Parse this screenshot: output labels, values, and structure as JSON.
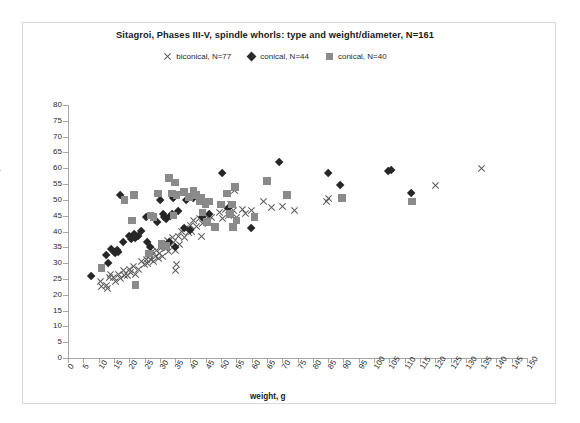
{
  "chart_data": {
    "type": "scatter",
    "title": "Sitagroi, Phases III-V, spindle whorls: type and weight/diameter, N=161",
    "xlabel": "weight, g",
    "ylabel": "diameter, mm",
    "xlim": [
      0,
      150
    ],
    "ylim": [
      0,
      80
    ],
    "xtick_step": 5,
    "ytick_step": 5,
    "xticks": [
      0,
      5,
      10,
      15,
      20,
      25,
      30,
      35,
      40,
      45,
      50,
      55,
      60,
      65,
      70,
      75,
      80,
      85,
      90,
      95,
      100,
      105,
      110,
      115,
      120,
      125,
      130,
      135,
      140,
      145,
      150
    ],
    "yticks": [
      0,
      5,
      10,
      15,
      20,
      25,
      30,
      35,
      40,
      45,
      50,
      55,
      60,
      65,
      70,
      75,
      80
    ],
    "grid": false,
    "legend_position": "top-center",
    "colors": {
      "biconical": "#595959",
      "conical_diamond": "#262626",
      "conical_square": "#8a8a8a",
      "axis": "#a6a6a6",
      "text": "#1a1a1a",
      "frame": "#d8d8d8",
      "background": "#ffffff"
    },
    "series": [
      {
        "name": "biconical, N=77",
        "marker": "cross",
        "color": "#595959",
        "points": [
          [
            10.5,
            24.0
          ],
          [
            11.0,
            22.6
          ],
          [
            12.5,
            23.0
          ],
          [
            13.0,
            22.0
          ],
          [
            13.5,
            25.5
          ],
          [
            14.0,
            26.5
          ],
          [
            15.0,
            25.5
          ],
          [
            15.5,
            24.0
          ],
          [
            16.5,
            26.5
          ],
          [
            17.0,
            25.0
          ],
          [
            18.0,
            27.5
          ],
          [
            18.5,
            26.0
          ],
          [
            19.5,
            26.0
          ],
          [
            20.0,
            28.0
          ],
          [
            20.5,
            27.0
          ],
          [
            21.5,
            29.0
          ],
          [
            22.0,
            26.5
          ],
          [
            23.0,
            28.0
          ],
          [
            24.0,
            30.5
          ],
          [
            25.0,
            29.5
          ],
          [
            25.5,
            31.0
          ],
          [
            26.0,
            30.0
          ],
          [
            26.5,
            32.5
          ],
          [
            27.0,
            31.0
          ],
          [
            27.5,
            33.5
          ],
          [
            28.0,
            30.5
          ],
          [
            28.5,
            32.0
          ],
          [
            29.0,
            34.0
          ],
          [
            29.5,
            31.5
          ],
          [
            30.0,
            33.0
          ],
          [
            30.5,
            35.0
          ],
          [
            31.0,
            32.0
          ],
          [
            31.5,
            36.0
          ],
          [
            32.0,
            34.5
          ],
          [
            32.5,
            37.0
          ],
          [
            33.0,
            33.5
          ],
          [
            33.5,
            35.5
          ],
          [
            34.0,
            38.0
          ],
          [
            34.5,
            36.5
          ],
          [
            35.0,
            34.0
          ],
          [
            35.0,
            27.5
          ],
          [
            35.5,
            29.5
          ],
          [
            36.0,
            38.5
          ],
          [
            36.5,
            36.0
          ],
          [
            37.0,
            40.0
          ],
          [
            38.0,
            38.0
          ],
          [
            38.5,
            41.0
          ],
          [
            39.5,
            39.5
          ],
          [
            40.0,
            42.0
          ],
          [
            40.5,
            40.0
          ],
          [
            41.0,
            43.5
          ],
          [
            42.0,
            41.5
          ],
          [
            43.0,
            44.0
          ],
          [
            43.5,
            38.5
          ],
          [
            44.0,
            42.5
          ],
          [
            45.0,
            45.0
          ],
          [
            46.0,
            43.0
          ],
          [
            47.0,
            44.5
          ],
          [
            48.0,
            41.5
          ],
          [
            49.5,
            46.0
          ],
          [
            50.5,
            44.0
          ],
          [
            51.5,
            47.0
          ],
          [
            52.5,
            45.0
          ],
          [
            53.0,
            48.5
          ],
          [
            54.0,
            46.5
          ],
          [
            54.5,
            53.0
          ],
          [
            55.0,
            44.5
          ],
          [
            57.0,
            47.0
          ],
          [
            58.0,
            45.5
          ],
          [
            60.0,
            46.5
          ],
          [
            64.0,
            49.5
          ],
          [
            66.5,
            47.5
          ],
          [
            70.0,
            48.0
          ],
          [
            74.0,
            46.5
          ],
          [
            84.5,
            49.5
          ],
          [
            85.0,
            50.5
          ],
          [
            120.0,
            54.5
          ],
          [
            135.0,
            60.0
          ]
        ]
      },
      {
        "name": "conical, N=44",
        "marker": "diamond",
        "color": "#262626",
        "points": [
          [
            7.5,
            26.0
          ],
          [
            12.5,
            32.5
          ],
          [
            13.0,
            30.0
          ],
          [
            14.0,
            34.5
          ],
          [
            15.0,
            33.5
          ],
          [
            15.5,
            33.0
          ],
          [
            16.0,
            34.0
          ],
          [
            16.5,
            33.5
          ],
          [
            17.0,
            51.5
          ],
          [
            18.0,
            36.5
          ],
          [
            20.0,
            38.5
          ],
          [
            20.5,
            37.5
          ],
          [
            21.5,
            39.0
          ],
          [
            22.0,
            38.0
          ],
          [
            23.0,
            38.5
          ],
          [
            24.0,
            40.0
          ],
          [
            25.5,
            44.5
          ],
          [
            26.0,
            36.5
          ],
          [
            27.0,
            35.0
          ],
          [
            28.0,
            45.0
          ],
          [
            29.0,
            43.0
          ],
          [
            30.0,
            50.0
          ],
          [
            31.0,
            45.5
          ],
          [
            31.5,
            44.5
          ],
          [
            32.0,
            44.0
          ],
          [
            33.0,
            36.5
          ],
          [
            33.5,
            45.0
          ],
          [
            34.0,
            45.5
          ],
          [
            34.5,
            50.5
          ],
          [
            35.0,
            35.0
          ],
          [
            36.0,
            46.5
          ],
          [
            38.0,
            41.0
          ],
          [
            38.5,
            50.0
          ],
          [
            40.0,
            40.5
          ],
          [
            41.0,
            50.5
          ],
          [
            44.0,
            44.5
          ],
          [
            46.0,
            45.5
          ],
          [
            50.5,
            58.5
          ],
          [
            52.5,
            47.5
          ],
          [
            60.0,
            41.0
          ],
          [
            69.0,
            62.0
          ],
          [
            85.0,
            58.5
          ],
          [
            89.0,
            54.5
          ],
          [
            104.5,
            59.0
          ],
          [
            105.5,
            59.5
          ],
          [
            112.0,
            52.0
          ]
        ]
      },
      {
        "name": "conical, N=40",
        "marker": "square",
        "color": "#8a8a8a",
        "points": [
          [
            11.0,
            28.5
          ],
          [
            18.5,
            50.0
          ],
          [
            21.0,
            43.5
          ],
          [
            21.5,
            51.5
          ],
          [
            22.0,
            23.0
          ],
          [
            26.5,
            33.0
          ],
          [
            27.0,
            45.0
          ],
          [
            28.0,
            44.5
          ],
          [
            29.5,
            52.0
          ],
          [
            30.5,
            36.0
          ],
          [
            31.5,
            35.5
          ],
          [
            32.0,
            35.5
          ],
          [
            33.0,
            57.0
          ],
          [
            34.0,
            52.0
          ],
          [
            34.5,
            45.0
          ],
          [
            35.0,
            55.5
          ],
          [
            35.5,
            51.5
          ],
          [
            38.0,
            52.5
          ],
          [
            39.5,
            51.0
          ],
          [
            41.0,
            53.0
          ],
          [
            42.0,
            51.5
          ],
          [
            43.0,
            49.5
          ],
          [
            43.5,
            50.5
          ],
          [
            44.0,
            46.0
          ],
          [
            45.0,
            48.5
          ],
          [
            45.5,
            43.0
          ],
          [
            46.0,
            49.5
          ],
          [
            48.0,
            41.5
          ],
          [
            50.0,
            48.5
          ],
          [
            52.0,
            52.0
          ],
          [
            53.0,
            45.5
          ],
          [
            53.5,
            48.5
          ],
          [
            54.0,
            41.5
          ],
          [
            54.5,
            54.0
          ],
          [
            55.0,
            43.5
          ],
          [
            61.0,
            44.5
          ],
          [
            65.0,
            56.0
          ],
          [
            71.5,
            51.5
          ],
          [
            89.5,
            50.5
          ],
          [
            112.5,
            49.5
          ]
        ]
      }
    ]
  },
  "legend": {
    "entries": [
      {
        "label": "biconical, N=77",
        "marker": "cross-marker"
      },
      {
        "label": "conical, N=44",
        "marker": "diamond-marker"
      },
      {
        "label": "conical, N=40",
        "marker": "square-marker"
      }
    ]
  }
}
